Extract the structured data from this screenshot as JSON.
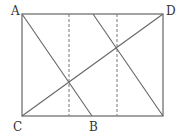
{
  "diagram": {
    "type": "geometry",
    "rectangle": {
      "x1": 22,
      "y1": 14,
      "x2": 163,
      "y2": 116
    },
    "points": {
      "A": {
        "label": "A",
        "x": 22,
        "y": 14
      },
      "D": {
        "label": "D",
        "x": 163,
        "y": 14
      },
      "C": {
        "label": "C",
        "x": 22,
        "y": 116
      },
      "B": {
        "label": "B",
        "x": 92,
        "y": 116
      }
    },
    "segments": [
      {
        "name": "AB",
        "from": "A",
        "to": "B"
      },
      {
        "name": "CD",
        "from": "C",
        "to": "D"
      },
      {
        "name": "top-to-bottom-right",
        "from": [
          93,
          14
        ],
        "to": [
          163,
          116
        ]
      }
    ],
    "dashed_lines": [
      {
        "x": 69,
        "y1": 14,
        "y2": 116
      },
      {
        "x": 117,
        "y1": 14,
        "y2": 116
      }
    ],
    "colors": {
      "line": "#666666",
      "label": "#333333"
    }
  }
}
